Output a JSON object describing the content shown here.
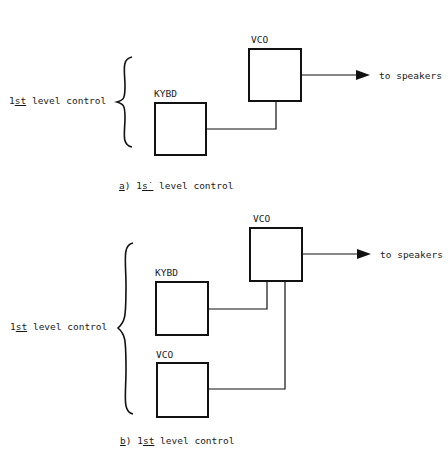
{
  "diagram_a": {
    "bracket_label_prefix": "1",
    "bracket_label_ord": "st",
    "bracket_label_rest": " level control",
    "kybd_label": "KYBD",
    "vco_label": "VCO",
    "output_label": "to speakers",
    "caption_letter": "a",
    "caption_paren": ")",
    "caption_prefix": "1",
    "caption_ord": "s˙",
    "caption_rest": " level control"
  },
  "diagram_b": {
    "bracket_label_prefix": "1",
    "bracket_label_ord": "st",
    "bracket_label_rest": " level control",
    "kybd_label": "KYBD",
    "vco_top_label": "VCO",
    "vco_bottom_label": "VCO",
    "output_label": "to speakers",
    "caption_letter": "b",
    "caption_paren": ")",
    "caption_prefix": "1",
    "caption_ord": "st",
    "caption_rest": " level control"
  },
  "colors": {
    "ink": "#111111",
    "background": "#ffffff"
  }
}
